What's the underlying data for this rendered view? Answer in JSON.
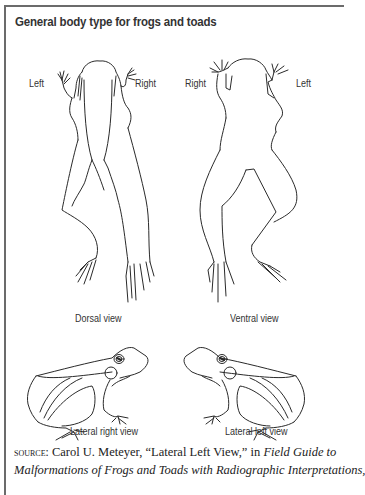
{
  "figure": {
    "title": "General body type for frogs and toads",
    "panels": [
      {
        "id": "dorsal",
        "caption": "Dorsal view",
        "side_labels": {
          "left": "Left",
          "right": "Right"
        }
      },
      {
        "id": "ventral",
        "caption": "Ventral view",
        "side_labels": {
          "left": "Right",
          "right": "Left"
        }
      },
      {
        "id": "lateral-right",
        "caption": "Lateral right view"
      },
      {
        "id": "lateral-left",
        "caption": "Lateral left view"
      }
    ],
    "source": {
      "label": "source:",
      "line1_text": " Carol U. Meteyer, “Lateral Left View,” in ",
      "line1_italic": "Field Guide to",
      "line2_italic": "Malformations of Frogs and Toads with Radiographic Interpretations,"
    }
  },
  "colors": {
    "frame": "#6b6b6b",
    "title": "#333333",
    "line_art": "#2a2a2a"
  }
}
